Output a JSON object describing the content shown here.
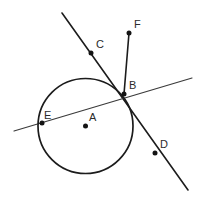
{
  "figure": {
    "type": "geometry-diagram",
    "width": 206,
    "height": 204,
    "background_color": "#ffffff",
    "stroke_color": "#1c1c1c",
    "label_color": "#2b2b2b",
    "point_color": "#141414"
  },
  "circle": {
    "name": "circle-A",
    "center_label": "A",
    "cx": 85.5,
    "cy": 126,
    "r": 47.5
  },
  "points": [
    {
      "id": "A",
      "label": "A",
      "x": 85.5,
      "y": 126,
      "label_x": 89,
      "label_y": 112,
      "role": "center",
      "dot": true
    },
    {
      "id": "B",
      "label": "B",
      "x": 124,
      "y": 94,
      "label_x": 129,
      "label_y": 80,
      "role": "on-circle-intersection",
      "dot": true
    },
    {
      "id": "C",
      "label": "C",
      "x": 91,
      "y": 53,
      "label_x": 96,
      "label_y": 39,
      "role": "on-line-cd",
      "dot": true
    },
    {
      "id": "D",
      "label": "D",
      "x": 155,
      "y": 153,
      "label_x": 160,
      "label_y": 139,
      "role": "on-line-cd",
      "dot": true
    },
    {
      "id": "E",
      "label": "E",
      "x": 42,
      "y": 123,
      "label_x": 44,
      "label_y": 110,
      "role": "on-circle",
      "dot": true
    },
    {
      "id": "F",
      "label": "F",
      "x": 129,
      "y": 33,
      "label_x": 134,
      "label_y": 19,
      "role": "segment-endpoint",
      "dot": true
    }
  ],
  "lines": [
    {
      "id": "line-cd",
      "name": "line-through-c-b-d",
      "x1": 62,
      "y1": 13,
      "x2": 188,
      "y2": 190,
      "weight": "thick"
    },
    {
      "id": "line-eb",
      "name": "secant-line-through-e-and-b",
      "x1": 14,
      "y1": 131,
      "x2": 192,
      "y2": 78,
      "weight": "thin"
    },
    {
      "id": "segment-fb",
      "name": "segment-f-to-b",
      "x1": 129,
      "y1": 33,
      "x2": 124,
      "y2": 94,
      "weight": "thick"
    }
  ]
}
